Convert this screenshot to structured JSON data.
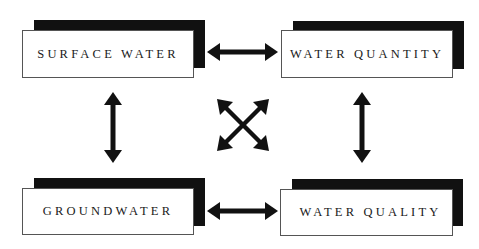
{
  "diagram": {
    "nodes": [
      {
        "id": "surface-water",
        "label": "SURFACE WATER"
      },
      {
        "id": "water-quantity",
        "label": "WATER QUANTITY"
      },
      {
        "id": "groundwater",
        "label": "GROUNDWATER"
      },
      {
        "id": "water-quality",
        "label": "WATER QUALITY"
      }
    ],
    "edges": [
      {
        "from": "surface-water",
        "to": "water-quantity",
        "type": "bidirectional"
      },
      {
        "from": "groundwater",
        "to": "water-quality",
        "type": "bidirectional"
      },
      {
        "from": "surface-water",
        "to": "groundwater",
        "type": "bidirectional"
      },
      {
        "from": "water-quantity",
        "to": "water-quality",
        "type": "bidirectional"
      },
      {
        "from": "surface-water",
        "to": "water-quality",
        "type": "bidirectional"
      },
      {
        "from": "water-quantity",
        "to": "groundwater",
        "type": "bidirectional"
      }
    ],
    "colors": {
      "ink": "#111111",
      "box_fill": "#ffffff",
      "border": "#555555"
    }
  }
}
